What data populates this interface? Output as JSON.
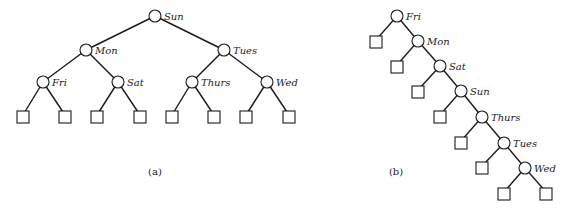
{
  "colors": {
    "ink": "#1a1a1a",
    "background": "#ffffff"
  },
  "diagrams": [
    {
      "caption": "(a)",
      "caption_pos": [
        155,
        175
      ],
      "nodes": [
        {
          "id": "sun",
          "label": "Sun",
          "x": 155,
          "y": 16
        },
        {
          "id": "mon",
          "label": "Mon",
          "x": 86,
          "y": 50
        },
        {
          "id": "tues",
          "label": "Tues",
          "x": 224,
          "y": 50
        },
        {
          "id": "fri",
          "label": "Fri",
          "x": 43,
          "y": 82
        },
        {
          "id": "sat",
          "label": "Sat",
          "x": 118,
          "y": 82
        },
        {
          "id": "thurs",
          "label": "Thurs",
          "x": 192,
          "y": 82
        },
        {
          "id": "wed",
          "label": "Wed",
          "x": 267,
          "y": 82
        }
      ],
      "leaves": [
        {
          "parent": "fri",
          "x": 23,
          "y": 115
        },
        {
          "parent": "fri",
          "x": 65,
          "y": 115
        },
        {
          "parent": "sat",
          "x": 97,
          "y": 115
        },
        {
          "parent": "sat",
          "x": 140,
          "y": 115
        },
        {
          "parent": "thurs",
          "x": 172,
          "y": 115
        },
        {
          "parent": "thurs",
          "x": 214,
          "y": 115
        },
        {
          "parent": "wed",
          "x": 246,
          "y": 115
        },
        {
          "parent": "wed",
          "x": 289,
          "y": 115
        }
      ],
      "edges": [
        [
          "sun",
          "mon"
        ],
        [
          "sun",
          "tues"
        ],
        [
          "mon",
          "fri"
        ],
        [
          "mon",
          "sat"
        ],
        [
          "tues",
          "thurs"
        ],
        [
          "tues",
          "wed"
        ]
      ]
    },
    {
      "caption": "(b)",
      "caption_pos": [
        396,
        175
      ],
      "nodes": [
        {
          "id": "fri",
          "label": "Fri",
          "x": 397,
          "y": 16
        },
        {
          "id": "mon",
          "label": "Mon",
          "x": 418,
          "y": 41
        },
        {
          "id": "sat",
          "label": "Sat",
          "x": 440,
          "y": 66
        },
        {
          "id": "sun",
          "label": "Sun",
          "x": 461,
          "y": 91
        },
        {
          "id": "thurs",
          "label": "Thurs",
          "x": 482,
          "y": 117
        },
        {
          "id": "tues",
          "label": "Tues",
          "x": 504,
          "y": 143
        },
        {
          "id": "wed",
          "label": "Wed",
          "x": 525,
          "y": 168
        }
      ],
      "leaves": [
        {
          "parent": "fri",
          "x": 376,
          "y": 40
        },
        {
          "parent": "mon",
          "x": 397,
          "y": 65
        },
        {
          "parent": "sat",
          "x": 418,
          "y": 90
        },
        {
          "parent": "sun",
          "x": 440,
          "y": 115
        },
        {
          "parent": "thurs",
          "x": 461,
          "y": 141
        },
        {
          "parent": "tues",
          "x": 482,
          "y": 166
        },
        {
          "parent": "wed",
          "x": 504,
          "y": 192
        },
        {
          "parent": "wed",
          "x": 546,
          "y": 192
        }
      ],
      "edges": [
        [
          "fri",
          "mon"
        ],
        [
          "mon",
          "sat"
        ],
        [
          "sat",
          "sun"
        ],
        [
          "sun",
          "thurs"
        ],
        [
          "thurs",
          "tues"
        ],
        [
          "tues",
          "wed"
        ]
      ]
    }
  ]
}
